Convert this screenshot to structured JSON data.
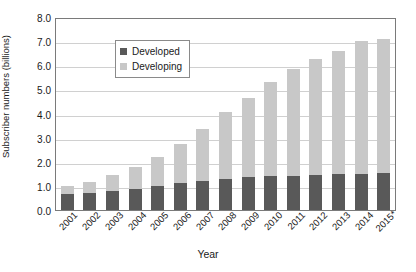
{
  "chart_data": {
    "type": "bar",
    "stacked": true,
    "title": "",
    "xlabel": "Year",
    "ylabel": "Subscriber numbers (billions)",
    "ylim": [
      0.0,
      8.0
    ],
    "ytick_step": 1.0,
    "ytick_labels": [
      "8.0",
      "7.0",
      "6.0",
      "5.0",
      "4.0",
      "3.0",
      "2.0",
      "1.0",
      "0.0"
    ],
    "grid": true,
    "legend_position": "top-left",
    "categories": [
      "2001",
      "2002",
      "2003",
      "2004",
      "2005",
      "2006",
      "2007",
      "2008",
      "2009",
      "2010",
      "2011",
      "2012",
      "2013",
      "2014",
      "2015*"
    ],
    "series": [
      {
        "name": "Developed",
        "color": "#595959",
        "values": [
          0.65,
          0.72,
          0.8,
          0.87,
          0.98,
          1.1,
          1.22,
          1.3,
          1.37,
          1.42,
          1.43,
          1.45,
          1.48,
          1.5,
          1.52
        ]
      },
      {
        "name": "Developing",
        "color": "#c8c8c8",
        "values": [
          0.35,
          0.43,
          0.65,
          0.91,
          1.22,
          1.65,
          2.13,
          2.75,
          3.28,
          3.88,
          4.42,
          4.8,
          5.12,
          5.5,
          5.58
        ]
      }
    ],
    "totals": [
      1.0,
      1.15,
      1.45,
      1.78,
      2.2,
      2.75,
      3.35,
      4.05,
      4.65,
      5.3,
      5.85,
      6.25,
      6.6,
      7.0,
      7.1
    ]
  }
}
